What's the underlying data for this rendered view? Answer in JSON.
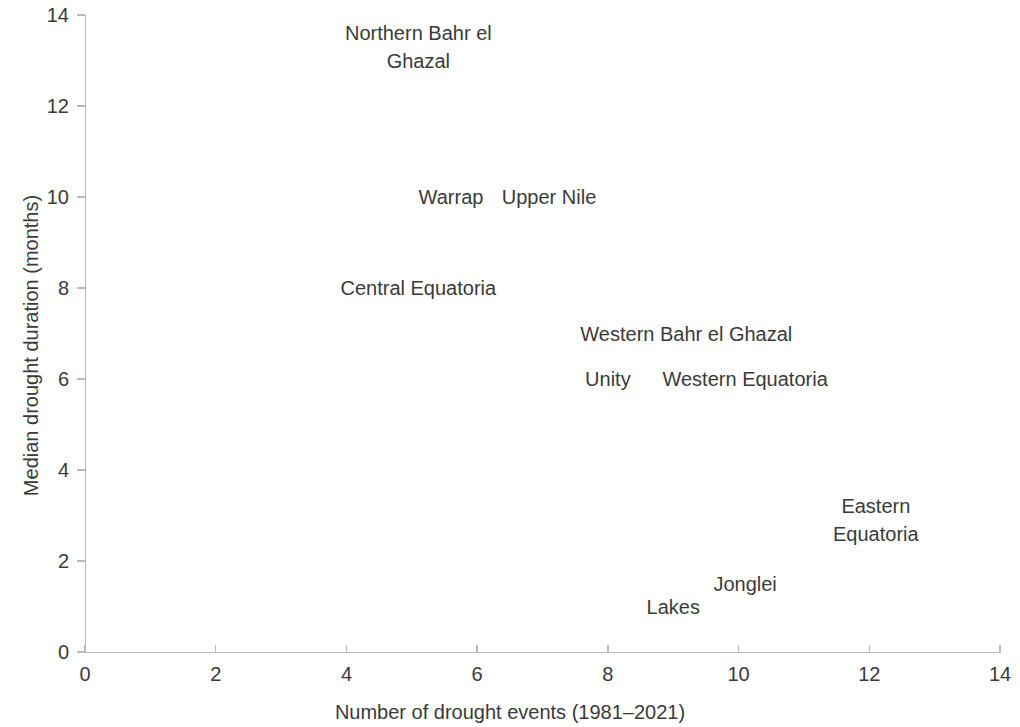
{
  "chart_data": {
    "type": "scatter",
    "title": "",
    "subtitle": "",
    "xlabel": "Number of drought events (1981–2021)",
    "ylabel": "Median drought duration (months)",
    "xlim": [
      0,
      14
    ],
    "ylim": [
      0,
      14
    ],
    "xticks": [
      0,
      2,
      4,
      6,
      8,
      10,
      12,
      14
    ],
    "yticks": [
      0,
      2,
      4,
      6,
      8,
      10,
      12,
      14
    ],
    "xtick_labels": [
      "0",
      "2",
      "4",
      "6",
      "8",
      "10",
      "12",
      "14"
    ],
    "ytick_labels": [
      "0",
      "2",
      "4",
      "6",
      "8",
      "10",
      "12",
      "14"
    ],
    "grid": false,
    "legend": "none",
    "marker_style": "text-label-only",
    "annotations": [
      {
        "label": "Northern Bahr el Ghazal",
        "x": 3.6,
        "y": 13.3,
        "label_x": 5.1,
        "label_y": 13.3
      },
      {
        "label": "Warrap",
        "x": 4.7,
        "y": 10.0,
        "label_x": 5.6,
        "label_y": 10.0
      },
      {
        "label": "Upper Nile",
        "x": 6.5,
        "y": 10.0,
        "label_x": 7.1,
        "label_y": 10.0
      },
      {
        "label": "Central Equatoria",
        "x": 3.9,
        "y": 8.0,
        "label_x": 5.1,
        "label_y": 8.0
      },
      {
        "label": "Western Bahr el Ghazal",
        "x": 7.4,
        "y": 7.0,
        "label_x": 9.2,
        "label_y": 7.0
      },
      {
        "label": "Unity",
        "x": 7.7,
        "y": 6.0,
        "label_x": 8.0,
        "label_y": 6.0
      },
      {
        "label": "Western Equatoria",
        "x": 8.8,
        "y": 6.0,
        "label_x": 10.1,
        "label_y": 6.0
      },
      {
        "label": "Eastern Equatoria",
        "x": 11.0,
        "y": 2.9,
        "label_x": 12.1,
        "label_y": 2.9
      },
      {
        "label": "Jonglei",
        "x": 9.7,
        "y": 1.5,
        "label_x": 10.1,
        "label_y": 1.5
      },
      {
        "label": "Lakes",
        "x": 8.7,
        "y": 1.0,
        "label_x": 9.0,
        "label_y": 1.0
      }
    ],
    "series": [
      {
        "name": "South Sudan states",
        "points": [
          {
            "name": "Northern Bahr el Ghazal",
            "x": 3.6,
            "y": 13.3
          },
          {
            "name": "Warrap",
            "x": 4.7,
            "y": 10.0
          },
          {
            "name": "Upper Nile",
            "x": 6.5,
            "y": 10.0
          },
          {
            "name": "Central Equatoria",
            "x": 3.9,
            "y": 8.0
          },
          {
            "name": "Western Bahr el Ghazal",
            "x": 7.4,
            "y": 7.0
          },
          {
            "name": "Unity",
            "x": 7.7,
            "y": 6.0
          },
          {
            "name": "Western Equatoria",
            "x": 8.8,
            "y": 6.0
          },
          {
            "name": "Eastern Equatoria",
            "x": 11.0,
            "y": 2.9
          },
          {
            "name": "Jonglei",
            "x": 9.7,
            "y": 1.5
          },
          {
            "name": "Lakes",
            "x": 8.7,
            "y": 1.0
          }
        ]
      }
    ],
    "colors": {
      "text": "#3a3a3a",
      "axis": "#b9b9b9",
      "background": "#ffffff"
    },
    "label_overrides": [
      {
        "label": "Northern Bahr el Ghazal",
        "display": "Northern Bahr el\nGhazal"
      }
    ]
  }
}
